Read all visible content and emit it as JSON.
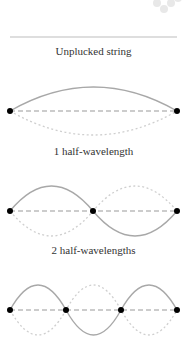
{
  "diagram": {
    "labels": {
      "unplucked": "Unplucked string",
      "mode1": "1 half-wavelength",
      "mode2": "2 half-wavelengths"
    },
    "colors": {
      "string_solid": "#a8a8a8",
      "string_dotted": "#cfcfcf",
      "rest_dashed": "#9a9a9a",
      "node": "#000000",
      "rule": "#bdbdbd",
      "watermark": "#e6e6e6"
    },
    "panels": [
      {
        "name": "mode-1",
        "half_wavelengths": 1,
        "nodes_x": [
          10,
          177
        ],
        "rest_y": 111,
        "amplitude": 24
      },
      {
        "name": "mode-2",
        "half_wavelengths": 2,
        "nodes_x": [
          10,
          93,
          177
        ],
        "rest_y": 211,
        "amplitude": 25
      },
      {
        "name": "mode-3",
        "half_wavelengths": 3,
        "nodes_x": [
          10,
          66,
          121,
          177
        ],
        "rest_y": 310,
        "amplitude": 25
      }
    ]
  }
}
